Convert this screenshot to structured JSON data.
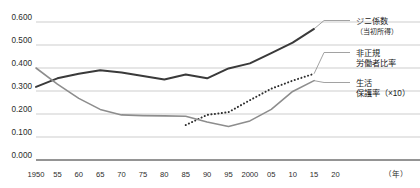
{
  "chart_data": {
    "type": "line",
    "title": "",
    "xlabel": "（年）",
    "ylabel": "",
    "ylim": [
      0.0,
      0.6
    ],
    "xlim": [
      1950,
      2022
    ],
    "grid": true,
    "legend_position": "right",
    "ytick_labels": [
      "0.600",
      "0.500",
      "0.400",
      "0.300",
      "0.200",
      "0.100",
      "0.000"
    ],
    "ytick_values": [
      0.6,
      0.5,
      0.4,
      0.3,
      0.2,
      0.1,
      0.0
    ],
    "xtick_labels": [
      "1950",
      "55",
      "60",
      "65",
      "70",
      "75",
      "80",
      "85",
      "90",
      "95",
      "2000",
      "05",
      "10",
      "15",
      "20"
    ],
    "xtick_values": [
      1950,
      1955,
      1960,
      1965,
      1970,
      1975,
      1980,
      1985,
      1990,
      1995,
      2000,
      2005,
      2010,
      2015,
      2020
    ],
    "series": [
      {
        "name": "ジニ係数",
        "sublabel": "（当初所得）",
        "legend_line1": "ジニ係数",
        "legend_line2": "（当初所得）",
        "style": "solid-dark",
        "color": "#3a3a3a",
        "x": [
          1950,
          1955,
          1960,
          1965,
          1970,
          1975,
          1980,
          1985,
          1990,
          1995,
          2000,
          2005,
          2010,
          2015
        ],
        "values": [
          0.318,
          0.355,
          0.375,
          0.39,
          0.38,
          0.365,
          0.35,
          0.372,
          0.355,
          0.398,
          0.42,
          0.465,
          0.51,
          0.57
        ]
      },
      {
        "name": "非正規労働者比率",
        "legend_line1": "非正規",
        "legend_line2": "労働者比率",
        "style": "dotted",
        "color": "#2f2f2f",
        "x": [
          1985,
          1990,
          1995,
          2000,
          2005,
          2010,
          2015
        ],
        "values": [
          0.152,
          0.196,
          0.208,
          0.26,
          0.31,
          0.345,
          0.375
        ]
      },
      {
        "name": "生活保護率（×10）",
        "legend_line1": "生活",
        "legend_line2": "保護率（×10）",
        "style": "solid-gray",
        "color": "#8d8d8d",
        "x": [
          1950,
          1955,
          1960,
          1965,
          1970,
          1975,
          1980,
          1985,
          1990,
          1995,
          2000,
          2005,
          2010,
          2015
        ],
        "values": [
          0.4,
          0.33,
          0.268,
          0.22,
          0.196,
          0.193,
          0.192,
          0.19,
          0.165,
          0.146,
          0.17,
          0.22,
          0.298,
          0.345
        ]
      }
    ]
  }
}
